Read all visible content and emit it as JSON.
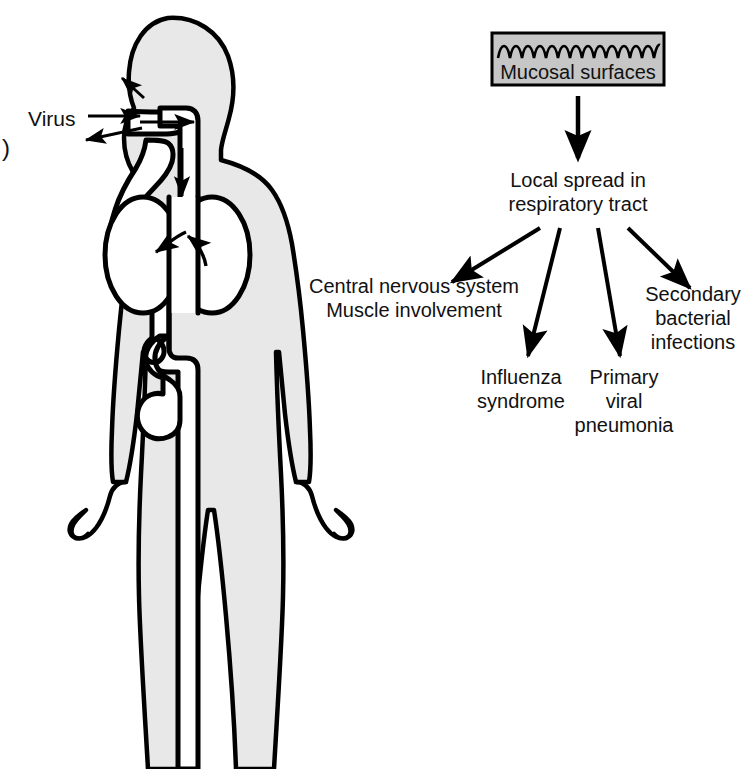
{
  "figure": {
    "type": "medical-illustration",
    "panel_label": ")",
    "colors": {
      "body_fill": "#e8e8e8",
      "outline": "#000000",
      "organ_fill": "#ffffff",
      "box_fill": "#c6c6c6",
      "background": "#ffffff",
      "text": "#111111"
    }
  },
  "body_diagram": {
    "entry_label": "Virus",
    "parts": [
      {
        "name": "head"
      },
      {
        "name": "nasal-passage"
      },
      {
        "name": "oral-cavity"
      },
      {
        "name": "trachea"
      },
      {
        "name": "left-lung"
      },
      {
        "name": "right-lung"
      },
      {
        "name": "gastrointestinal-tract"
      },
      {
        "name": "stomach"
      },
      {
        "name": "torso"
      },
      {
        "name": "left-arm"
      },
      {
        "name": "right-arm"
      },
      {
        "name": "left-leg"
      },
      {
        "name": "right-leg"
      }
    ],
    "arrows": [
      {
        "name": "virus-inhalation-arrow",
        "direction": "inward"
      },
      {
        "name": "virus-shedding-arrow",
        "direction": "outward"
      },
      {
        "name": "nasal-entry-arrow",
        "direction": "into-nose"
      },
      {
        "name": "airway-entry-arrow",
        "direction": "into-airway"
      },
      {
        "name": "trachea-descent-arrow",
        "direction": "downward"
      },
      {
        "name": "left-lung-arrow",
        "direction": "into-left-lung"
      },
      {
        "name": "right-lung-arrow",
        "direction": "into-right-lung"
      }
    ]
  },
  "flowchart": {
    "source_box": {
      "label": "Mucosal surfaces",
      "wave_peaks": 9
    },
    "stage": {
      "line1": "Local spread in",
      "line2": "respiratory tract"
    },
    "outcomes": [
      {
        "id": "cns",
        "lines": [
          "Central nervous system",
          "Muscle involvement"
        ],
        "arrow_direction": "down-left"
      },
      {
        "id": "influenza-syndrome",
        "lines": [
          "Influenza",
          "syndrome"
        ],
        "arrow_direction": "down"
      },
      {
        "id": "primary-viral-pneumonia",
        "lines": [
          "Primary",
          "viral",
          "pneumonia"
        ],
        "arrow_direction": "down"
      },
      {
        "id": "secondary-bacterial-infections",
        "lines": [
          "Secondary",
          "bacterial",
          "infections"
        ],
        "arrow_direction": "down-right"
      }
    ]
  }
}
